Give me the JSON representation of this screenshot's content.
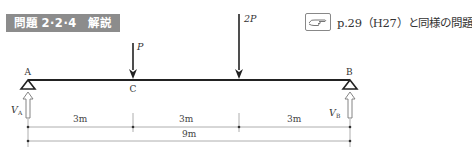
{
  "header": {
    "badge": "問題 2·2·4　解説",
    "reference": {
      "icon": "pointing-hand-icon",
      "text": "p.29（H27）と同様の問題"
    }
  },
  "diagram": {
    "points": {
      "A": "A",
      "C": "C",
      "B": "B"
    },
    "loads": [
      {
        "label": "P",
        "at": "C"
      },
      {
        "label": "2P",
        "at": "6m from A"
      }
    ],
    "reactions": {
      "A": {
        "symbol": "V",
        "sub": "A"
      },
      "B": {
        "symbol": "V",
        "sub": "B"
      }
    },
    "dimensions": {
      "segments": [
        "3m",
        "3m",
        "3m"
      ],
      "total": "9m"
    },
    "colors": {
      "beam": "#222222",
      "badge_bg": "#8c8c8c",
      "dim_line": "#999999"
    }
  }
}
